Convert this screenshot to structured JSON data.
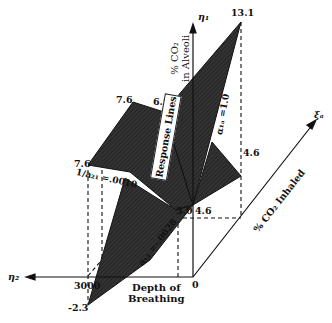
{
  "diagram": {
    "axes": {
      "eta1": {
        "symbol": "η₁",
        "label_line1": "% CO₂",
        "label_line2": "in Alveoli"
      },
      "eta2": {
        "symbol": "η₂",
        "label_line1": "Depth of",
        "label_line2": "Breathing"
      },
      "xi": {
        "symbol": "ξₐ",
        "label": "% CO₂ Inhaled"
      },
      "origin": "0"
    },
    "values": {
      "peak": "13.1",
      "upper_left": "7.6",
      "upper_mid": "6.8",
      "left": "7.6",
      "right": "4.6",
      "center_left": "5.0",
      "center_right": "4.6",
      "bottom": "-2.3",
      "depth_tick": "3000"
    },
    "annotations": {
      "response_lines": "Response Lines",
      "a21": "1/a₂₁ =.0010",
      "a12": "a₁₂ =-.0028",
      "a1a": "α₁ₐ =1.0"
    },
    "colors": {
      "plane_fill": "#2b2b2b",
      "plane_light": "#4a4a4a",
      "line": "#111111",
      "background": "#ffffff"
    }
  }
}
